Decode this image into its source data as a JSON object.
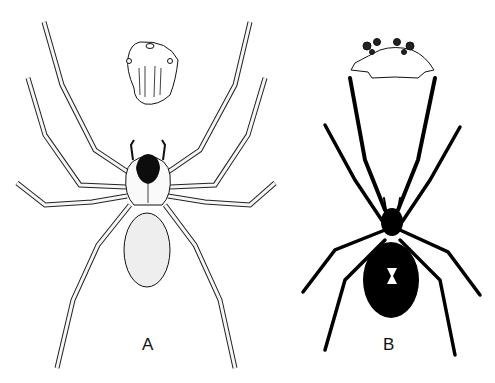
{
  "figure": {
    "panels": [
      {
        "label": "A",
        "subject": "spider-line-drawing",
        "inset": "carapace-detail",
        "colors": {
          "outline": "#111111",
          "fill": "#f4f4f4",
          "carapace_mark": "#0d0d0d"
        }
      },
      {
        "label": "B",
        "subject": "black-widow-silhouette",
        "inset": "eye-region-detail",
        "marking": "hourglass",
        "colors": {
          "body": "#000000",
          "marking": "#ffffff"
        }
      }
    ]
  }
}
